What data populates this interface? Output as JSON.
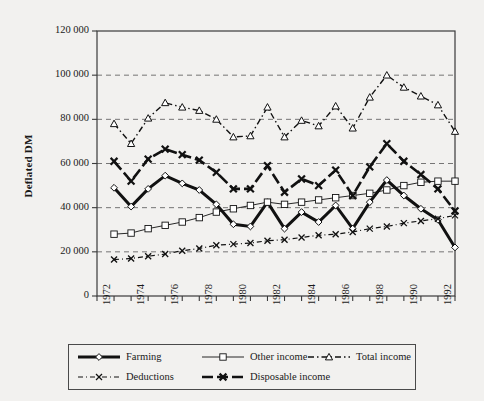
{
  "chart_data": {
    "type": "line",
    "title": "",
    "xlabel": "",
    "ylabel": "Deflated DM",
    "xlim": [
      1972,
      1993
    ],
    "ylim": [
      0,
      120000
    ],
    "ytick_labels": [
      "120 000",
      "100 000",
      "80 000",
      "60 000",
      "40 000",
      "20 000",
      "0"
    ],
    "ytick_values": [
      120000,
      100000,
      80000,
      60000,
      40000,
      20000,
      0
    ],
    "xtick_labels": [
      "1972",
      "1974",
      "1976",
      "1978",
      "1980",
      "1982",
      "1984",
      "1986",
      "1988",
      "1990",
      "1992"
    ],
    "xtick_values": [
      1972,
      1974,
      1976,
      1978,
      1980,
      1982,
      1984,
      1986,
      1988,
      1990,
      1992
    ],
    "grid": "horizontal",
    "legend_position": "bottom",
    "x": [
      1973,
      1974,
      1975,
      1976,
      1977,
      1978,
      1979,
      1980,
      1981,
      1982,
      1983,
      1984,
      1985,
      1986,
      1987,
      1988,
      1989,
      1990,
      1991,
      1992,
      1993
    ],
    "series": [
      {
        "name": "Farming",
        "marker": "diamond",
        "line": "solid-thick",
        "values": [
          49000,
          40500,
          48500,
          54500,
          51000,
          48000,
          41500,
          32500,
          31500,
          42500,
          30500,
          38000,
          33500,
          41000,
          30500,
          42500,
          52500,
          45500,
          39500,
          34500,
          22000
        ]
      },
      {
        "name": "Other income",
        "marker": "square",
        "line": "solid-thin",
        "values": [
          28000,
          28500,
          30500,
          32000,
          33500,
          35500,
          38000,
          39500,
          41000,
          42500,
          41500,
          42500,
          43500,
          44500,
          45500,
          46500,
          48000,
          50000,
          51500,
          52000,
          52000
        ]
      },
      {
        "name": "Total income",
        "marker": "triangle",
        "line": "dash-dot",
        "values": [
          78000,
          69000,
          80500,
          87500,
          85500,
          84000,
          80000,
          72000,
          72500,
          85500,
          72000,
          79500,
          77000,
          86000,
          76000,
          90000,
          100000,
          94500,
          90500,
          86500,
          74500
        ]
      },
      {
        "name": "Deductions",
        "marker": "x-small",
        "line": "dash-dot-thin",
        "values": [
          16500,
          17000,
          18000,
          19000,
          20500,
          21500,
          23000,
          23500,
          24000,
          25000,
          25500,
          26500,
          27500,
          28000,
          29000,
          30500,
          31500,
          33000,
          34000,
          35000,
          36500
        ]
      },
      {
        "name": "Disposable income",
        "marker": "x-bold",
        "line": "dash-thick",
        "values": [
          61000,
          52000,
          62000,
          66500,
          64000,
          61500,
          56000,
          48500,
          48500,
          59000,
          47000,
          53000,
          50000,
          57000,
          45500,
          58500,
          69000,
          61000,
          55000,
          48500,
          38500
        ]
      }
    ]
  },
  "legend": {
    "entries": [
      {
        "label": "Farming",
        "key": "farming-key"
      },
      {
        "label": "Other income",
        "key": "other-income-key"
      },
      {
        "label": "Total income",
        "key": "total-income-key"
      },
      {
        "label": "Deductions",
        "key": "deductions-key"
      },
      {
        "label": "Disposable income",
        "key": "disposable-income-key"
      }
    ]
  }
}
